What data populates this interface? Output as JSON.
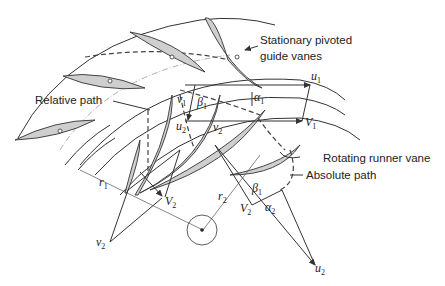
{
  "diagram": {
    "type": "turbine velocity triangle diagram",
    "labels": {
      "guide_vanes_line1": "Stationary pivoted",
      "guide_vanes_line2": "guide vanes",
      "relative_path": "Relative path",
      "rotating_runner_vane": "Rotating runner vane",
      "absolute_path": "Absolute path"
    },
    "symbols": {
      "u1": {
        "base": "u",
        "sub": "1"
      },
      "V1": {
        "base": "V",
        "sub": "1"
      },
      "v1": {
        "base": "v",
        "sub": "1"
      },
      "beta1_top": {
        "base": "β",
        "sub": "1"
      },
      "alpha1": {
        "base": "α",
        "sub": "1"
      },
      "u2_top": {
        "base": "u",
        "sub": "2"
      },
      "v2_top": {
        "base": "v",
        "sub": "2"
      },
      "r1": {
        "base": "r",
        "sub": "1"
      },
      "r2": {
        "base": "r",
        "sub": "2"
      },
      "V2_left": {
        "base": "V",
        "sub": "2"
      },
      "v2_bottom": {
        "base": "v",
        "sub": "2"
      },
      "beta1_bottom": {
        "base": "β",
        "sub": "1"
      },
      "V2_right": {
        "base": "V",
        "sub": "2"
      },
      "alpha2": {
        "base": "α",
        "sub": "2"
      },
      "u2_bottom": {
        "base": "u",
        "sub": "2"
      }
    },
    "colors": {
      "vane_fill": "#cfcfcf",
      "stroke": "#333333",
      "background": "#ffffff"
    }
  }
}
